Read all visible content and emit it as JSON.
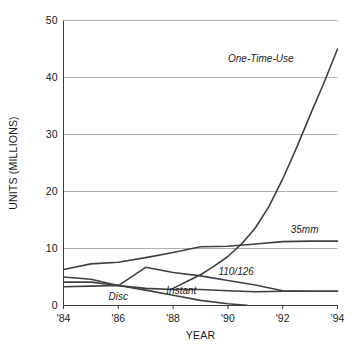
{
  "chart_data": {
    "type": "line",
    "title": "",
    "xlabel": "YEAR",
    "ylabel": "UNITS (MILLIONS)",
    "xlim": [
      1984,
      1994
    ],
    "ylim": [
      0,
      50
    ],
    "grid": true,
    "legend_position": "inline-end-of-line",
    "x_tick_labels": [
      "'84",
      "'86",
      "'88",
      "'90",
      "'92",
      "'94"
    ],
    "x_tick_values": [
      1984,
      1986,
      1988,
      1990,
      1992,
      1994
    ],
    "y_tick_labels": [
      "0",
      "10",
      "20",
      "30",
      "40",
      "50"
    ],
    "y_tick_values": [
      0,
      10,
      20,
      30,
      40,
      50
    ],
    "series": [
      {
        "name": "One-Time-Use",
        "label": "One-Time-Use",
        "label_x": 1991.2,
        "label_y": 42.7,
        "x": [
          1988.0,
          1988.5,
          1989.0,
          1989.5,
          1990.0,
          1990.5,
          1991.0,
          1991.5,
          1992.0,
          1992.5,
          1993.0,
          1993.5,
          1994.0
        ],
        "values": [
          3.0,
          4.2,
          5.4,
          6.9,
          8.6,
          10.8,
          13.6,
          17.4,
          22.2,
          27.6,
          33.4,
          39.0,
          45.0
        ]
      },
      {
        "name": "35mm",
        "label": "35mm",
        "label_x": 1992.8,
        "label_y": 12.8,
        "x": [
          1984.0,
          1985.0,
          1986.0,
          1987.0,
          1988.0,
          1989.0,
          1990.0,
          1991.0,
          1992.0,
          1993.0,
          1994.0
        ],
        "values": [
          6.3,
          7.3,
          7.6,
          8.4,
          9.3,
          10.3,
          10.4,
          10.8,
          11.2,
          11.3,
          11.3
        ]
      },
      {
        "name": "110/126",
        "label": "110/126",
        "label_x": 1990.3,
        "label_y": 5.4,
        "x": [
          1984.0,
          1985.0,
          1986.0,
          1987.0,
          1988.0,
          1989.0,
          1990.0,
          1991.0,
          1992.0,
          1993.0,
          1994.0
        ],
        "values": [
          5.0,
          4.6,
          3.5,
          6.7,
          5.8,
          5.2,
          4.4,
          3.6,
          2.6,
          2.5,
          2.5
        ]
      },
      {
        "name": "Instant",
        "label": "Instant",
        "label_x": 1988.3,
        "label_y": 2.1,
        "x": [
          1984.0,
          1985.0,
          1986.0,
          1987.0,
          1988.0,
          1989.0,
          1990.0,
          1991.0,
          1992.0,
          1993.0,
          1994.0
        ],
        "values": [
          3.3,
          3.4,
          3.5,
          3.0,
          2.8,
          2.8,
          2.6,
          2.4,
          2.5,
          2.5,
          2.5
        ]
      },
      {
        "name": "Disc",
        "label": "Disc",
        "label_x": 1986.0,
        "label_y": 0.9,
        "x": [
          1984.0,
          1985.0,
          1986.0,
          1987.0,
          1988.0,
          1989.0,
          1990.0,
          1990.7
        ],
        "values": [
          4.1,
          4.1,
          3.5,
          2.7,
          1.8,
          0.9,
          0.3,
          0.05
        ]
      }
    ]
  }
}
